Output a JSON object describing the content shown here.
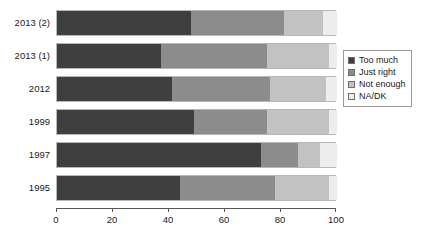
{
  "chart_data": {
    "type": "bar",
    "orientation": "horizontal",
    "stacked": true,
    "stacked_percent": true,
    "title": "",
    "subtitle": "",
    "xlabel": "",
    "ylabel": "",
    "xlim": [
      0,
      100
    ],
    "xticks": [
      0,
      20,
      40,
      60,
      80,
      100
    ],
    "xticklabels": [
      "0",
      "20",
      "40",
      "60",
      "80",
      "100"
    ],
    "grid": false,
    "legend_position": "right",
    "categories": [
      "2013 (2)",
      "2013 (1)",
      "2012",
      "1999",
      "1997",
      "1995"
    ],
    "series": [
      {
        "name": "Too much",
        "color": "#3f3f3f",
        "values": [
          48,
          37,
          41,
          49,
          73,
          44
        ]
      },
      {
        "name": "Just right",
        "color": "#8c8c8c",
        "values": [
          33,
          38,
          35,
          26,
          13,
          34
        ]
      },
      {
        "name": "Not enough",
        "color": "#c2c2c2",
        "values": [
          14,
          22,
          20,
          22,
          8,
          19
        ]
      },
      {
        "name": "NA/DK",
        "color": "#ededed",
        "values": [
          5,
          3,
          4,
          3,
          6,
          3
        ]
      }
    ]
  },
  "legend": {
    "items": [
      {
        "label": "Too much",
        "color": "#3f3f3f"
      },
      {
        "label": "Just right",
        "color": "#8c8c8c"
      },
      {
        "label": "Not enough",
        "color": "#c2c2c2"
      },
      {
        "label": "NA/DK",
        "color": "#ededed"
      }
    ]
  },
  "axis": {
    "x_ticks": [
      "0",
      "20",
      "40",
      "60",
      "80",
      "100"
    ]
  },
  "y_categories": [
    "2013 (2)",
    "2013 (1)",
    "2012",
    "1999",
    "1997",
    "1995"
  ]
}
